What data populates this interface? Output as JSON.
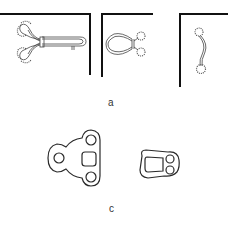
{
  "figure": {
    "panels": [
      {
        "id": "a",
        "label": "a",
        "items": [
          "hook-and-eye-long",
          "hook-eye-loop",
          "s-hook"
        ]
      },
      {
        "id": "c",
        "label": "c",
        "items": [
          "three-hole-bracket",
          "two-hole-bracket"
        ]
      }
    ],
    "colors": {
      "stroke": "#2a2a2a",
      "line": "#111111",
      "background": "#ffffff",
      "label": "#333333"
    }
  }
}
